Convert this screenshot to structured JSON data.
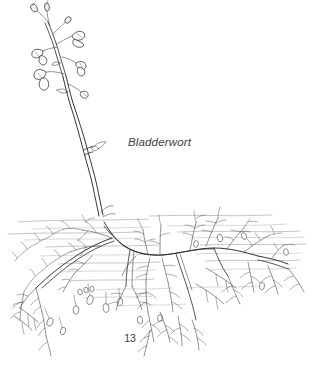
{
  "plate": {
    "title": "Bladderwort",
    "page_number": "13",
    "background_color": "#ffffff",
    "ink_color": "#2b2b2b",
    "waterline_color": "#8d8d8d",
    "illustration_type": "botanical line drawing",
    "subject": "Bladderwort (Utricularia) aquatic plant",
    "parts": {
      "flower_raceme_label": "flowering raceme",
      "flower_buds_label": "flower buds",
      "open_flowers_label": "open flowers",
      "emergent_stem_label": "emergent flowering stem",
      "water_surface_label": "water surface",
      "submerged_foliage_label": "finely divided submerged leaves",
      "bladder_traps_label": "bladder traps",
      "horizontal_stolon_label": "horizontal stolon"
    }
  }
}
